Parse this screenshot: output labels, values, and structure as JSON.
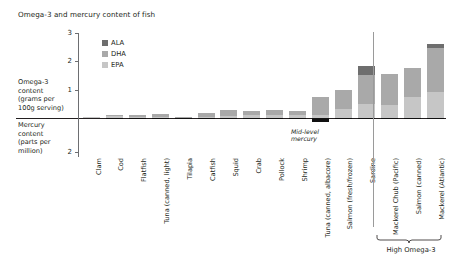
{
  "chart_data": {
    "type": "bar",
    "title": "Omega-3 and mercury content of fish",
    "subtitle": "",
    "xlabel": "",
    "ylabel": "Omega-3 content (grams per 100g serving)",
    "ylabel_secondary": "Mercury content (parts per million)",
    "grid": false,
    "legend_position": "upper-left-inside",
    "ylim": [
      0,
      3
    ],
    "ylim_secondary": [
      0,
      2
    ],
    "y_ticks": [
      "3",
      "2",
      "1"
    ],
    "y_ticks_secondary": [
      "2"
    ],
    "legend": [
      {
        "name": "ALA",
        "color": "#6e6e6e"
      },
      {
        "name": "DHA",
        "color": "#a9a9a9"
      },
      {
        "name": "EPA",
        "color": "#c6c6c6"
      }
    ],
    "categories": [
      "Clam",
      "Cod",
      "Flatfish",
      "Tuna (canned, light)",
      "Tilapia",
      "Catfish",
      "Squid",
      "Crab",
      "Pollock",
      "Shrimp",
      "Tuna (canned, albacore)",
      "Salmon (fresh/frozen)",
      "Sardine",
      "Mackerel Chub (Pacific)",
      "Salmon (canned)",
      "Mackerel (Atlantic)"
    ],
    "series": [
      {
        "name": "EPA",
        "color": "#c6c6c6",
        "values": [
          0.02,
          0.06,
          0.05,
          0.04,
          0.01,
          0.05,
          0.08,
          0.11,
          0.09,
          0.12,
          0.11,
          0.32,
          0.5,
          0.45,
          0.75,
          0.9
        ]
      },
      {
        "name": "DHA",
        "color": "#a9a9a9",
        "values": [
          0.03,
          0.06,
          0.07,
          0.09,
          0.04,
          0.12,
          0.19,
          0.13,
          0.21,
          0.13,
          0.62,
          0.68,
          1.0,
          1.1,
          1.0,
          1.55
        ]
      },
      {
        "name": "ALA",
        "color": "#6e6e6e",
        "values": [
          0.0,
          0.0,
          0.0,
          0.0,
          0.0,
          0.0,
          0.0,
          0.0,
          0.0,
          0.0,
          0.0,
          0.0,
          0.32,
          0.0,
          0.0,
          0.14
        ]
      }
    ],
    "mercury_series": {
      "name": "Mercury content (parts per million)",
      "color": "#111111",
      "values": [
        0.0,
        0.09,
        0.05,
        0.12,
        0.01,
        0.02,
        0.02,
        0.06,
        0.03,
        0.01,
        0.35,
        0.02,
        0.01,
        0.09,
        0.01,
        0.05
      ]
    },
    "annotations": [
      {
        "name": "mid-level-mercury",
        "text": "Mid-level mercury",
        "target": "Tuna (canned, albacore)"
      },
      {
        "name": "high-omega-3-bracket",
        "text": "High Omega-3",
        "targets": [
          "Mackerel Chub (Pacific)",
          "Salmon (canned)",
          "Mackerel (Atlantic)"
        ]
      }
    ]
  },
  "axis_captions": {
    "omega": {
      "title": "Omega-3",
      "title2": "content",
      "sub": "(grams per",
      "sub2": "100g serving)"
    },
    "mercury": {
      "title": "Mercury",
      "title2": "content",
      "sub": "(parts per",
      "sub2": "million)"
    }
  },
  "annotation_text": {
    "mid_mercury_line1": "Mid-level",
    "mid_mercury_line2": "mercury",
    "high_omega": "High Omega-3"
  }
}
